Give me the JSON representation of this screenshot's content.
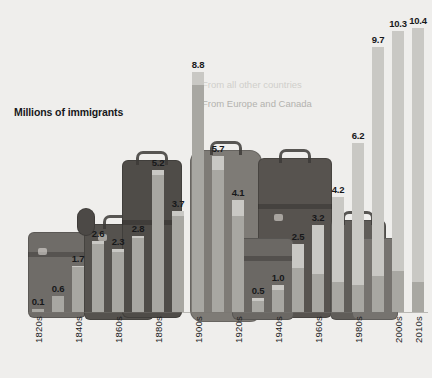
{
  "chart_data": {
    "type": "bar",
    "title": "",
    "subtitle": "",
    "xlabel": "",
    "ylabel": "Millions of immigrants",
    "ylim": [
      0,
      11.2
    ],
    "grid": false,
    "stacked": true,
    "legend_position": "inside-upper-middle",
    "categories": [
      "1820s",
      "1830s",
      "1840s",
      "1850s",
      "1860s",
      "1870s",
      "1880s",
      "1890s",
      "1900s",
      "1910s",
      "1920s",
      "1930s",
      "1940s",
      "1950s",
      "1960s",
      "1970s",
      "1980s",
      "1990s",
      "2000s",
      "2010s"
    ],
    "tick_labels": [
      "1820s",
      "1840s",
      "1860s",
      "1880s",
      "1900s",
      "1920s",
      "1940s",
      "1960s",
      "1980s",
      "2000s",
      "2010s"
    ],
    "totals": [
      0.1,
      0.6,
      1.7,
      2.6,
      2.3,
      2.8,
      5.2,
      3.7,
      8.8,
      5.7,
      4.1,
      0.5,
      1.0,
      2.5,
      3.2,
      4.2,
      6.2,
      9.7,
      10.3,
      10.4
    ],
    "data_labels": [
      "0.1",
      "0.6",
      "1.7",
      "2.6",
      "2.3",
      "2.8",
      "5.2",
      "3.7",
      "8.8",
      "5.7",
      "4.1",
      "0.5",
      "1.0",
      "2.5",
      "3.2",
      "4.2",
      "6.2",
      "9.7",
      "10.3",
      "10.4"
    ],
    "series": [
      {
        "name": "From Europe and Canada",
        "color": "#a8a7a2",
        "values": [
          0.1,
          0.6,
          1.65,
          2.5,
          2.2,
          2.7,
          5.0,
          3.5,
          8.3,
          5.2,
          3.5,
          0.4,
          0.8,
          1.6,
          1.4,
          1.1,
          1.0,
          1.3,
          1.5,
          1.1
        ]
      },
      {
        "name": "From all other countries",
        "color": "#c9c8c4",
        "values": [
          0.0,
          0.0,
          0.05,
          0.1,
          0.1,
          0.1,
          0.2,
          0.2,
          0.5,
          0.5,
          0.6,
          0.1,
          0.2,
          0.9,
          1.8,
          3.1,
          5.2,
          8.4,
          8.8,
          9.3
        ]
      }
    ],
    "legend": [
      {
        "label": "From all other countries",
        "color": "#c9c8c4"
      },
      {
        "label": "From Europe and Canada",
        "color": "#a8a7a2"
      }
    ],
    "axis_note": "Millions of immigrants"
  },
  "colors": {
    "background": "#efeeec",
    "other_countries": "#c9c8c4",
    "europe_canada": "#a8a7a2",
    "label_text": "#17181a",
    "axis_text": "#1c1d1f"
  }
}
